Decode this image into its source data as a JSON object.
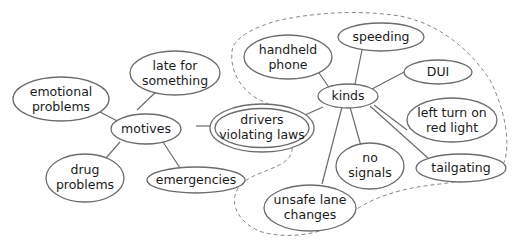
{
  "diagram": {
    "type": "concept-map",
    "central": {
      "line1": "drivers",
      "line2": "violating laws"
    },
    "motives": {
      "label": "motives",
      "children": [
        {
          "line1": "emotional",
          "line2": "problems"
        },
        {
          "line1": "late for",
          "line2": "something"
        },
        {
          "line1": "drug",
          "line2": "problems"
        },
        {
          "line1": "emergencies"
        }
      ]
    },
    "kinds": {
      "label": "kinds",
      "children": [
        {
          "line1": "handheld",
          "line2": "phone"
        },
        {
          "line1": "speeding"
        },
        {
          "line1": "DUI"
        },
        {
          "line1": "left turn on",
          "line2": "red light"
        },
        {
          "line1": "tailgating"
        },
        {
          "line1": "no",
          "line2": "signals"
        },
        {
          "line1": "unsafe lane",
          "line2": "changes"
        }
      ]
    }
  }
}
